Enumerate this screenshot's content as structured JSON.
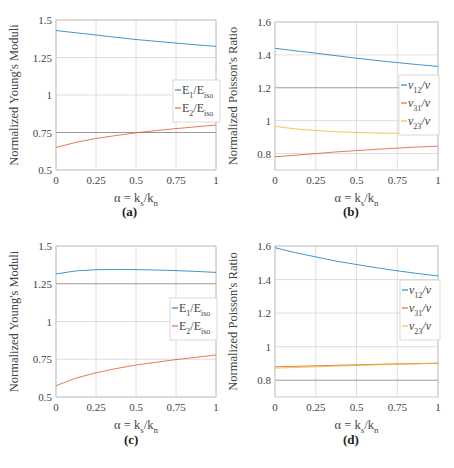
{
  "figure": {
    "panel_labels": [
      "(a)",
      "(b)",
      "(c)",
      "(d)"
    ]
  },
  "chart_data": [
    {
      "id": "a",
      "type": "line",
      "panel_label": "(a)",
      "title": "",
      "xlabel": "α = k_s/k_n",
      "ylabel": "Normalized Young's Moduli",
      "xlim": [
        0,
        1
      ],
      "ylim": [
        0.5,
        1.5
      ],
      "xticks": [
        0,
        0.25,
        0.5,
        0.75,
        1
      ],
      "xtick_labels": [
        "0",
        "0.25",
        "0.5",
        "0.75",
        "1"
      ],
      "yticks": [
        0.5,
        0.75,
        1,
        1.25,
        1.5
      ],
      "ytick_labels": [
        "0.5",
        "0.75",
        "1",
        "1.25",
        "1.5"
      ],
      "grid": true,
      "emphasized_gridline_y": 0.75,
      "legend_position": "east",
      "x": [
        0,
        0.125,
        0.25,
        0.375,
        0.5,
        0.625,
        0.75,
        0.875,
        1
      ],
      "series": [
        {
          "name": "E1/Eiso",
          "label_main": "E",
          "label_sub": "1",
          "label_den": "E",
          "label_den_sub": "iso",
          "color": "#0072BD",
          "values": [
            1.43,
            1.415,
            1.4,
            1.385,
            1.37,
            1.358,
            1.346,
            1.335,
            1.325
          ]
        },
        {
          "name": "E2/Eiso",
          "label_main": "E",
          "label_sub": "2",
          "label_den": "E",
          "label_den_sub": "iso",
          "color": "#D95319",
          "values": [
            0.65,
            0.685,
            0.71,
            0.73,
            0.748,
            0.763,
            0.776,
            0.788,
            0.8
          ]
        }
      ]
    },
    {
      "id": "b",
      "type": "line",
      "panel_label": "(b)",
      "title": "",
      "xlabel": "α = k_s/k_n",
      "ylabel": "Normalized Poisson's Ratio",
      "xlim": [
        0,
        1
      ],
      "ylim": [
        0.7,
        1.6
      ],
      "xticks": [
        0,
        0.25,
        0.5,
        0.75,
        1
      ],
      "xtick_labels": [
        "0",
        "0.25",
        "0.5",
        "0.75",
        "1"
      ],
      "yticks": [
        0.8,
        1.0,
        1.2,
        1.4,
        1.6
      ],
      "ytick_labels": [
        "0.8",
        "1",
        "1.2",
        "1.4",
        "1.6"
      ],
      "grid": true,
      "emphasized_gridline_y": 1.2,
      "legend_position": "east",
      "x": [
        0,
        0.125,
        0.25,
        0.375,
        0.5,
        0.625,
        0.75,
        0.875,
        1
      ],
      "series": [
        {
          "name": "ν12/ν",
          "label_main": "ν",
          "label_sub": "12",
          "label_den": "ν",
          "label_den_sub": "",
          "color": "#0072BD",
          "values": [
            1.44,
            1.425,
            1.41,
            1.395,
            1.38,
            1.366,
            1.353,
            1.341,
            1.33
          ]
        },
        {
          "name": "ν31/ν",
          "label_main": "ν",
          "label_sub": "31",
          "label_den": "ν",
          "label_den_sub": "",
          "color": "#D95319",
          "values": [
            0.78,
            0.79,
            0.8,
            0.81,
            0.818,
            0.826,
            0.833,
            0.84,
            0.845
          ]
        },
        {
          "name": "ν23/ν",
          "label_main": "ν",
          "label_sub": "23",
          "label_den": "ν",
          "label_den_sub": "",
          "color": "#EDB120",
          "values": [
            0.965,
            0.95,
            0.94,
            0.933,
            0.928,
            0.925,
            0.923,
            0.922,
            0.922
          ]
        }
      ]
    },
    {
      "id": "c",
      "type": "line",
      "panel_label": "(c)",
      "title": "",
      "xlabel": "α = k_s/k_n",
      "ylabel": "Normalized Young's Moduli",
      "xlim": [
        0,
        1
      ],
      "ylim": [
        0.5,
        1.5
      ],
      "xticks": [
        0,
        0.25,
        0.5,
        0.75,
        1
      ],
      "xtick_labels": [
        "0",
        "0.25",
        "0.5",
        "0.75",
        "1"
      ],
      "yticks": [
        0.5,
        0.75,
        1,
        1.25,
        1.5
      ],
      "ytick_labels": [
        "0.5",
        "0.75",
        "1",
        "1.25",
        "1.5"
      ],
      "grid": true,
      "emphasized_gridline_y": 1.25,
      "legend_position": "east",
      "x": [
        0,
        0.125,
        0.25,
        0.375,
        0.5,
        0.625,
        0.75,
        0.875,
        1
      ],
      "series": [
        {
          "name": "E1/Eiso",
          "label_main": "E",
          "label_sub": "1",
          "label_den": "E",
          "label_den_sub": "iso",
          "color": "#0072BD",
          "values": [
            1.315,
            1.335,
            1.343,
            1.345,
            1.344,
            1.341,
            1.337,
            1.332,
            1.325
          ]
        },
        {
          "name": "E2/Eiso",
          "label_main": "E",
          "label_sub": "2",
          "label_den": "E",
          "label_den_sub": "iso",
          "color": "#D95319",
          "values": [
            0.575,
            0.625,
            0.66,
            0.688,
            0.712,
            0.73,
            0.748,
            0.763,
            0.778
          ]
        }
      ]
    },
    {
      "id": "d",
      "type": "line",
      "panel_label": "(d)",
      "title": "",
      "xlabel": "α = k_s/k_n",
      "ylabel": "Normalized Poisson's Ratio",
      "xlim": [
        0,
        1
      ],
      "ylim": [
        0.7,
        1.6
      ],
      "xticks": [
        0,
        0.25,
        0.5,
        0.75,
        1
      ],
      "xtick_labels": [
        "0",
        "0.25",
        "0.5",
        "0.75",
        "1"
      ],
      "yticks": [
        0.8,
        1.0,
        1.2,
        1.4,
        1.6
      ],
      "ytick_labels": [
        "0.8",
        "1",
        "1.2",
        "1.4",
        "1.6"
      ],
      "grid": true,
      "emphasized_gridline_y": 0.8,
      "legend_position": "east",
      "x": [
        0,
        0.125,
        0.25,
        0.375,
        0.5,
        0.625,
        0.75,
        0.875,
        1
      ],
      "series": [
        {
          "name": "ν12/ν",
          "label_main": "ν",
          "label_sub": "12",
          "label_den": "ν",
          "label_den_sub": "",
          "color": "#0072BD",
          "values": [
            1.59,
            1.56,
            1.535,
            1.51,
            1.49,
            1.47,
            1.452,
            1.436,
            1.422
          ]
        },
        {
          "name": "ν31/ν",
          "label_main": "ν",
          "label_sub": "31",
          "label_den": "ν",
          "label_den_sub": "",
          "color": "#D95319",
          "values": [
            0.88,
            0.883,
            0.886,
            0.889,
            0.892,
            0.895,
            0.897,
            0.899,
            0.901
          ]
        },
        {
          "name": "ν23/ν",
          "label_main": "ν",
          "label_sub": "23",
          "label_den": "ν",
          "label_den_sub": "",
          "color": "#EDB120",
          "values": [
            0.872,
            0.876,
            0.88,
            0.884,
            0.888,
            0.892,
            0.895,
            0.898,
            0.902
          ]
        }
      ]
    }
  ]
}
